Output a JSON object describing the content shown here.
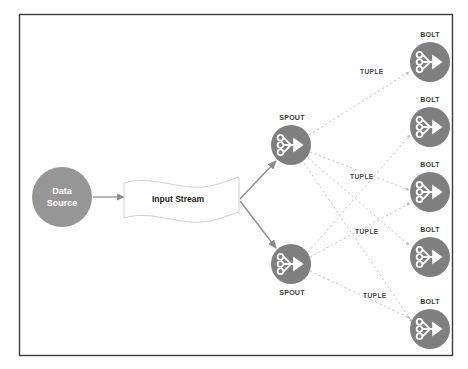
{
  "canvas": {
    "width": 468,
    "height": 369,
    "background": "#ffffff",
    "border_color": "#3c3c3c"
  },
  "colors": {
    "node_fill": "#7f7f7f",
    "node_icon": "#ffffff",
    "source_fill": "#969696",
    "arrow": "#808080",
    "dotted": "#b8b8b8",
    "stream_stroke": "#c8c8c8",
    "label_text": "#3b3b3b",
    "source_text": "#ffffff"
  },
  "diagram": {
    "source": {
      "label_line1": "Data",
      "label_line2": "Source",
      "cx": 62,
      "cy": 197,
      "r": 30
    },
    "stream": {
      "label": "Input Stream",
      "x": 123,
      "y": 181,
      "w": 116,
      "h": 36
    },
    "spouts": [
      {
        "label": "SPOUT",
        "cx": 291,
        "cy": 145,
        "r": 20,
        "label_pos": "above"
      },
      {
        "label": "SPOUT",
        "cx": 291,
        "cy": 264,
        "r": 20,
        "label_pos": "below"
      }
    ],
    "bolts": [
      {
        "label": "BOLT",
        "cx": 430,
        "cy": 62,
        "r": 20
      },
      {
        "label": "BOLT",
        "cx": 430,
        "cy": 127,
        "r": 20
      },
      {
        "label": "BOLT",
        "cx": 430,
        "cy": 192,
        "r": 20
      },
      {
        "label": "BOLT",
        "cx": 430,
        "cy": 257,
        "r": 20
      },
      {
        "label": "BOLT",
        "cx": 430,
        "cy": 329,
        "r": 20
      }
    ],
    "tuple_labels": [
      {
        "text": "TUPLE",
        "x": 360,
        "y": 72
      },
      {
        "text": "TUPLE",
        "x": 350,
        "y": 177
      },
      {
        "text": "TUPLE",
        "x": 355,
        "y": 232
      },
      {
        "text": "TUPLE",
        "x": 363,
        "y": 296
      }
    ],
    "icon_name": "spout-bolt-fanout-icon",
    "edges": {
      "solid": [
        {
          "from": "input-stream",
          "to": "spout-top"
        },
        {
          "from": "input-stream",
          "to": "spout-bottom"
        }
      ],
      "dotted": [
        {
          "from": "spout-top",
          "to": "bolt-1"
        },
        {
          "from": "spout-top",
          "to": "bolt-3"
        },
        {
          "from": "spout-top",
          "to": "bolt-4"
        },
        {
          "from": "spout-top",
          "to": "bolt-5"
        },
        {
          "from": "spout-bottom",
          "to": "bolt-2"
        },
        {
          "from": "spout-bottom",
          "to": "bolt-3"
        },
        {
          "from": "spout-bottom",
          "to": "bolt-5"
        }
      ]
    }
  }
}
